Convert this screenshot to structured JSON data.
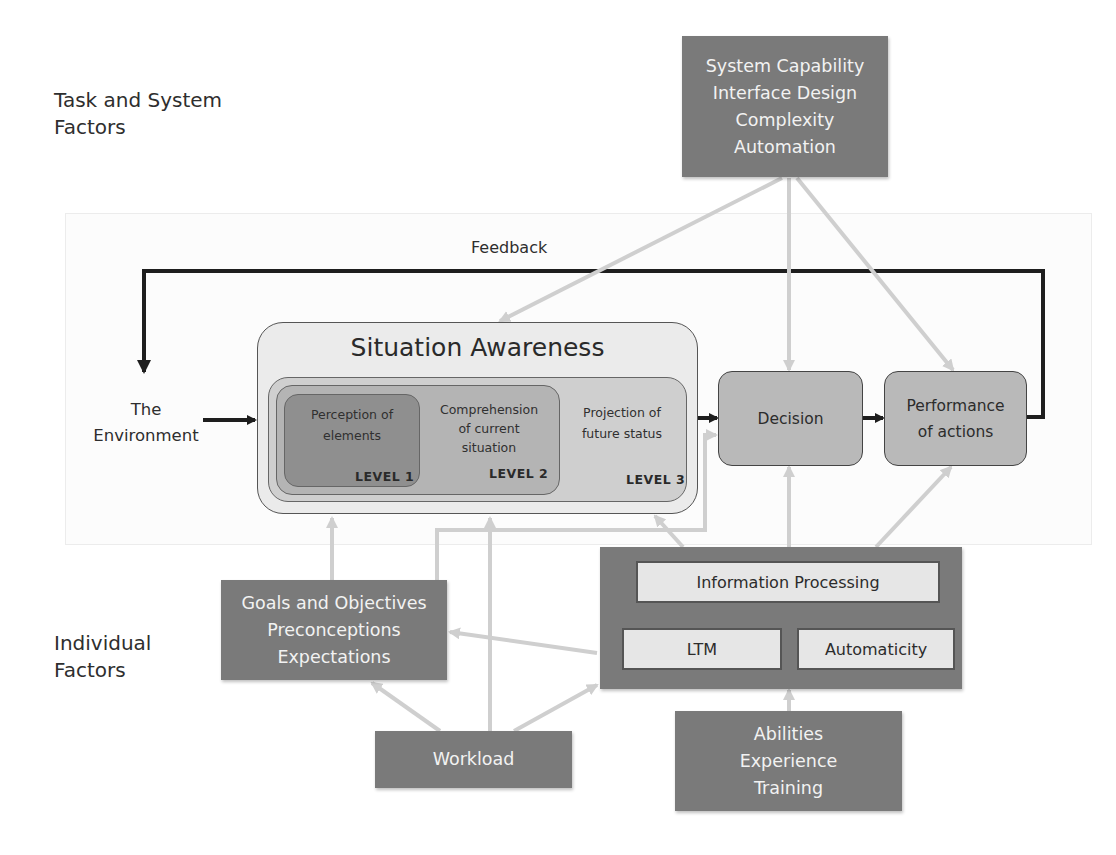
{
  "sections": {
    "task_system": "Task and System\nFactors",
    "task_system_line1": "Task and System",
    "task_system_line2": "Factors",
    "individual_line1": "Individual",
    "individual_line2": "Factors"
  },
  "task_factors_box": {
    "lines": [
      "System Capability",
      "Interface Design",
      "Complexity",
      "Automation"
    ]
  },
  "feedback_label": "Feedback",
  "environment": {
    "line1": "The",
    "line2": "Environment"
  },
  "situation_awareness": {
    "title": "Situation Awareness",
    "levels": [
      {
        "line1": "Perception of",
        "line2": "elements",
        "line3": "",
        "tag": "LEVEL 1"
      },
      {
        "line1": "Comprehension",
        "line2": "of current",
        "line3": "situation",
        "tag": "LEVEL 2"
      },
      {
        "line1": "Projection of",
        "line2": "future status",
        "line3": "",
        "tag": "LEVEL 3"
      }
    ]
  },
  "decision": {
    "label": "Decision"
  },
  "performance": {
    "line1": "Performance",
    "line2": "of actions"
  },
  "goals_box": {
    "lines": [
      "Goals and Objectives",
      "Preconceptions",
      "Expectations"
    ]
  },
  "processing_box": {
    "information_processing": "Information Processing",
    "ltm": "LTM",
    "automaticity": "Automaticity"
  },
  "workload_box": {
    "label": "Workload"
  },
  "abilities_box": {
    "lines": [
      "Abilities",
      "Experience",
      "Training"
    ]
  },
  "colors": {
    "dark_box": "#7a7a7a",
    "decision_box": "#b9b9b9",
    "level1": "#8f8f8f",
    "level2": "#b4b4b4",
    "level3": "#cfcfcf",
    "sa_outer": "#ebebeb",
    "light_arrow": "#cfcfcf",
    "dark_arrow": "#1e1e1e"
  }
}
